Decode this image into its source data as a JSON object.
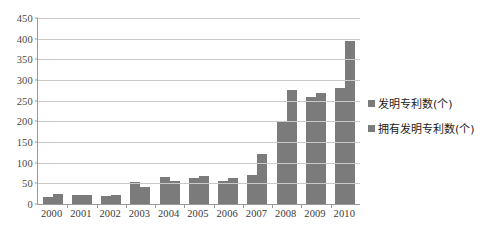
{
  "chart_data": {
    "type": "bar",
    "title": "",
    "subtitle": "",
    "xlabel": "",
    "ylabel": "",
    "ylim": [
      0,
      450
    ],
    "ytick_step": 50,
    "yticks": [
      "450",
      "400",
      "350",
      "300",
      "250",
      "200",
      "150",
      "100",
      "50",
      "0"
    ],
    "grid": true,
    "legend_position": "right",
    "categories": [
      "2000",
      "2001",
      "2002",
      "2003",
      "2004",
      "2005",
      "2006",
      "2007",
      "2008",
      "2009",
      "2010"
    ],
    "series": [
      {
        "name": "发明专利数(个)",
        "color": "#7b7b7b",
        "values": [
          16,
          21,
          19,
          54,
          65,
          62,
          56,
          70,
          198,
          258,
          280
        ]
      },
      {
        "name": "拥有发明专利数(个)",
        "color": "#7b7b7b",
        "values": [
          25,
          22,
          23,
          41,
          55,
          67,
          62,
          120,
          277,
          268,
          395
        ]
      }
    ]
  },
  "legend": {
    "items": [
      {
        "label": "发明专利数(个)",
        "marker": "square-marker"
      },
      {
        "label": "拥有发明专利数(个)",
        "marker": "square-marker"
      }
    ]
  }
}
